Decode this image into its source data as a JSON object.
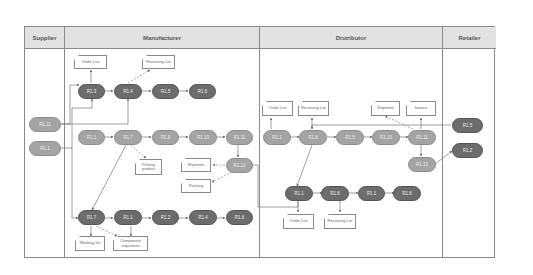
{
  "lanes": [
    {
      "label": "Supplier"
    },
    {
      "label": "Manufacturer"
    },
    {
      "label": "Distributor"
    },
    {
      "label": "Retailer"
    }
  ],
  "nodes": {
    "s1": "R1.11",
    "s2": "R1.1",
    "m_top_1": "R1.3",
    "m_top_2": "R1.4",
    "m_top_3": "R1.5",
    "m_top_4": "R1.6",
    "m_mid_1": "R1.1",
    "m_mid_2": "R1.7",
    "m_mid_3": "R1.8",
    "m_mid_4": "R1.10",
    "m_mid_5": "R1.11",
    "m_mid_6": "R1.12",
    "m_bot_1": "R1.7",
    "m_bot_2": "R1.1",
    "m_bot_3": "R1.2",
    "m_bot_4": "R1.4",
    "m_bot_5": "R1.6",
    "d_mid_1": "R1.1",
    "d_mid_2": "R1.6",
    "d_mid_3": "R1.5",
    "d_mid_4": "R1.10",
    "d_mid_5": "R1.11",
    "d_mid_6": "R1.12",
    "d_bot_1": "R1.1",
    "d_bot_2": "R1.6",
    "d_bot_3": "R1.1",
    "d_bot_4": "R1.6",
    "r1": "R1.5",
    "r2": "R1.2"
  },
  "documents": {
    "m_order_list": "Order List",
    "m_receiving_list": "Receiving List",
    "m_picking_product": "Picking product",
    "m_shipment": "Shipment",
    "m_packing": "Packing",
    "m_working_list": "Working list",
    "m_component_requisition": "Component requisition",
    "d_order_list_top": "Order List",
    "d_receiving_list_top": "Receiving List",
    "d_shipment": "Shipment",
    "d_invoice": "Invoice",
    "d_order_list_bot": "Order List",
    "d_receiving_list_bot": "Receiving List"
  },
  "colors": {
    "light_node": "#a4a4a4",
    "dark_node": "#6c6c6c",
    "header_bg": "#e2e2e2",
    "border": "#8a8a8a"
  }
}
